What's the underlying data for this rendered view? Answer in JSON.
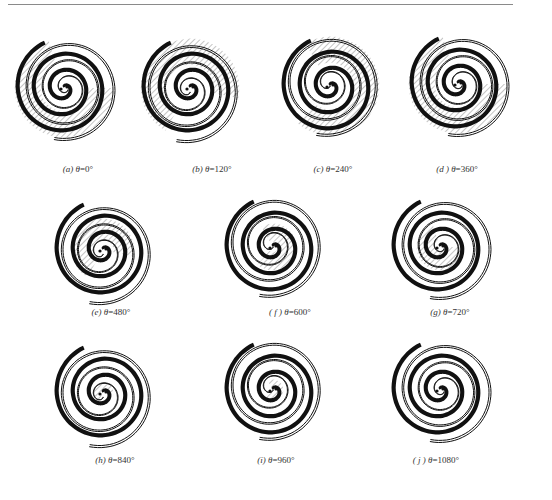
{
  "figure": {
    "colors": {
      "ink": "#111111",
      "hatch": "#555555",
      "rule": "#8a8a8a",
      "caption": "#333333"
    },
    "panels": [
      {
        "id": "a",
        "letter": "(a)",
        "symbol": "θ",
        "eq": "=",
        "value": "0°",
        "angle": 0,
        "cx": 64,
        "cy": 88,
        "r": 52,
        "cap_x": 78,
        "cap_y": 164,
        "hatched": "large"
      },
      {
        "id": "b",
        "letter": "(b)",
        "symbol": "θ",
        "eq": "=",
        "value": "120°",
        "angle": 120,
        "cx": 190,
        "cy": 88,
        "r": 52,
        "cap_x": 212,
        "cap_y": 164,
        "hatched": "large"
      },
      {
        "id": "c",
        "letter": "(c)",
        "symbol": "θ",
        "eq": "=",
        "value": "240°",
        "angle": 240,
        "cx": 330,
        "cy": 86,
        "r": 52,
        "cap_x": 333,
        "cap_y": 164,
        "hatched": "large"
      },
      {
        "id": "d",
        "letter": "(d )",
        "symbol": "θ",
        "eq": "=",
        "value": "360°",
        "angle": 360,
        "cx": 458,
        "cy": 84,
        "r": 52,
        "cap_x": 457,
        "cap_y": 164,
        "hatched": "large"
      },
      {
        "id": "e",
        "letter": "(e)",
        "symbol": "θ",
        "eq": "=",
        "value": "480°",
        "angle": 480,
        "cx": 103,
        "cy": 250,
        "r": 52,
        "cap_x": 111,
        "cap_y": 307,
        "hatched": "medium"
      },
      {
        "id": "f",
        "letter": "( f )",
        "symbol": "θ",
        "eq": "=",
        "value": "600°",
        "angle": 600,
        "cx": 273,
        "cy": 247,
        "r": 52,
        "cap_x": 290,
        "cap_y": 307,
        "hatched": "small"
      },
      {
        "id": "g",
        "letter": "(g)",
        "symbol": "θ",
        "eq": "=",
        "value": "720°",
        "angle": 720,
        "cx": 440,
        "cy": 247,
        "r": 52,
        "cap_x": 450,
        "cap_y": 307,
        "hatched": "small"
      },
      {
        "id": "h",
        "letter": "(h)",
        "symbol": "θ",
        "eq": "=",
        "value": "840°",
        "angle": 840,
        "cx": 103,
        "cy": 393,
        "r": 52,
        "cap_x": 115,
        "cap_y": 455,
        "hatched": "tiny"
      },
      {
        "id": "i",
        "letter": "(i)",
        "symbol": "θ",
        "eq": "=",
        "value": "960°",
        "angle": 960,
        "cx": 273,
        "cy": 390,
        "r": 52,
        "cap_x": 276,
        "cap_y": 455,
        "hatched": "tiny"
      },
      {
        "id": "j",
        "letter": "( j )",
        "symbol": "θ",
        "eq": "=",
        "value": "1080°",
        "angle": 1080,
        "cx": 440,
        "cy": 390,
        "r": 52,
        "cap_x": 436,
        "cap_y": 455,
        "hatched": "none"
      }
    ]
  }
}
